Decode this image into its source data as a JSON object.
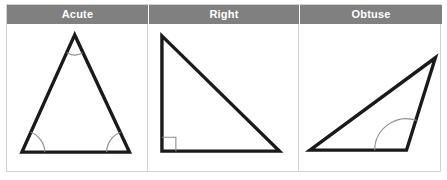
{
  "table": {
    "columns": [
      {
        "header": "Acute",
        "figure_name": "acute-triangle",
        "angle_markers": [
          "arc-apex",
          "arc-bottom-left",
          "arc-bottom-right"
        ]
      },
      {
        "header": "Right",
        "figure_name": "right-triangle",
        "angle_markers": [
          "right-angle-square-bottom-left"
        ]
      },
      {
        "header": "Obtuse",
        "figure_name": "obtuse-triangle",
        "angle_markers": [
          "arc-bottom-right-obtuse"
        ]
      }
    ]
  },
  "colors": {
    "header_background": "#808080",
    "header_text": "#ffffff",
    "table_border": "#d2d2d2",
    "shape_stroke": "#1a1a1a",
    "angle_marker_stroke": "#8c8c8c",
    "page_background": "#ffffff"
  },
  "figures": {
    "acute": {
      "vertices": [
        [
          68,
          11
        ],
        [
          15,
          129
        ],
        [
          123,
          129
        ]
      ],
      "stroke_width": 3.4
    },
    "right": {
      "vertices": [
        [
          14,
          12
        ],
        [
          14,
          128
        ],
        [
          132,
          128
        ]
      ],
      "stroke_width": 3.4,
      "square_size": 14
    },
    "obtuse": {
      "vertices": [
        [
          11,
          127
        ],
        [
          137,
          34
        ],
        [
          108,
          127
        ]
      ],
      "stroke_width": 3.4
    }
  }
}
